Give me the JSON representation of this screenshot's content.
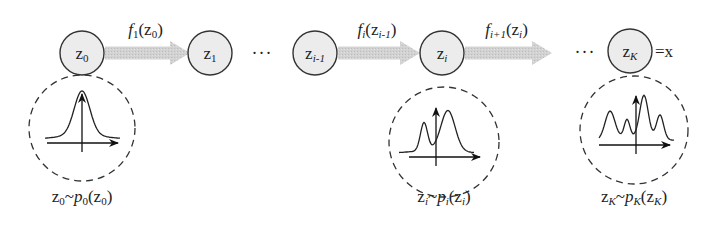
{
  "diagram": {
    "colors": {
      "node_fill": "#ececec",
      "node_stroke": "#333333",
      "arrow_fill": "#cfcfcf",
      "dashed_stroke": "#333333",
      "curve_stroke": "#222222"
    },
    "nodes": [
      {
        "id": "z0",
        "label": "z",
        "sub": "0",
        "sub_italic": false,
        "cx": 82,
        "cy": 53
      },
      {
        "id": "z1",
        "label": "z",
        "sub": "1",
        "sub_italic": false,
        "cx": 210,
        "cy": 53
      },
      {
        "id": "zi-1",
        "label": "z",
        "sub": "i-1",
        "sub_italic": true,
        "cx": 315,
        "cy": 53
      },
      {
        "id": "zi",
        "label": "z",
        "sub": "i",
        "sub_italic": true,
        "cx": 442,
        "cy": 53
      },
      {
        "id": "zK",
        "label": "z",
        "sub": "K",
        "sub_italic": true,
        "cx": 630,
        "cy": 51
      }
    ],
    "node_radius": 22,
    "transforms": [
      {
        "id": "f1",
        "fn": "f",
        "fn_sub": "1",
        "arg": "z",
        "arg_sub": "0",
        "x1": 105,
        "x2": 190,
        "y": 53
      },
      {
        "id": "fi",
        "fn": "f",
        "fn_sub": "i",
        "arg": "z",
        "arg_sub": "i-1",
        "x1": 338,
        "x2": 420,
        "y": 53
      },
      {
        "id": "fi+1",
        "fn": "f",
        "fn_sub": "i+1",
        "arg": "z",
        "arg_sub": "i",
        "x1": 465,
        "x2": 552,
        "y": 53
      }
    ],
    "ellipses": [
      {
        "id": "dots-1",
        "text": "···",
        "x": 262,
        "y": 53
      },
      {
        "id": "dots-2",
        "text": "···",
        "x": 585,
        "y": 52
      }
    ],
    "final_equals": {
      "text": "=x",
      "x": 655,
      "y": 52
    },
    "distributions": [
      {
        "id": "p0",
        "shape": "unimodal",
        "cx": 82,
        "cy": 128,
        "r": 53,
        "label": {
          "var": "z",
          "var_sub": "0",
          "tilde": "~",
          "p": "p",
          "p_sub": "0",
          "arg": "z",
          "arg_sub": "0"
        },
        "label_y": 197
      },
      {
        "id": "pi",
        "shape": "bimodal",
        "cx": 444,
        "cy": 142,
        "r": 55,
        "label": {
          "var": "z",
          "var_sub": "i",
          "tilde": "~",
          "p": "p",
          "p_sub": "i",
          "arg": "z",
          "arg_sub": "i"
        },
        "label_y": 197
      },
      {
        "id": "pK",
        "shape": "multimodal",
        "cx": 634,
        "cy": 130,
        "r": 54,
        "label": {
          "var": "z",
          "var_sub": "K",
          "tilde": "~",
          "p": "p",
          "p_sub": "K",
          "arg": "z",
          "arg_sub": "K"
        },
        "label_y": 197
      }
    ]
  }
}
